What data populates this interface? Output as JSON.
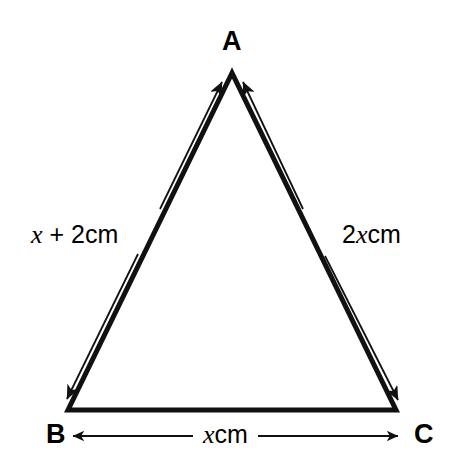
{
  "figure": {
    "type": "geometry-diagram",
    "shape": "triangle",
    "background_color": "#ffffff",
    "ink_color": "#000000",
    "vertices": [
      {
        "id": "A",
        "label": "A",
        "x": 232,
        "y": 73,
        "label_x": 222,
        "label_y": 28
      },
      {
        "id": "B",
        "label": "B",
        "x": 68,
        "y": 410,
        "label_x": 46,
        "label_y": 421
      },
      {
        "id": "C",
        "label": "C",
        "x": 396,
        "y": 410,
        "label_x": 414,
        "label_y": 421
      }
    ],
    "sides": [
      {
        "id": "AB",
        "from": "B",
        "to": "A",
        "label_plain": "x + 2cm",
        "label_parts": [
          {
            "text": "x",
            "style": "italic"
          },
          {
            "text": " + 2cm",
            "style": "upright"
          }
        ],
        "label_x": 29,
        "label_y": 222,
        "arrow": "double-headed",
        "arrow_side": "outside-left"
      },
      {
        "id": "AC",
        "from": "A",
        "to": "C",
        "label_plain": "2xcm",
        "label_parts": [
          {
            "text": "2",
            "style": "upright"
          },
          {
            "text": "x",
            "style": "italic"
          },
          {
            "text": "cm",
            "style": "upright"
          }
        ],
        "label_x": 340,
        "label_y": 222,
        "arrow": "double-headed",
        "arrow_side": "outside-right"
      },
      {
        "id": "BC",
        "from": "B",
        "to": "C",
        "label_plain": "xcm",
        "label_parts": [
          {
            "text": "x",
            "style": "italic"
          },
          {
            "text": "cm",
            "style": "upright"
          }
        ],
        "label_x": 197,
        "label_y": 422,
        "arrow": "double-headed",
        "arrow_side": "below"
      }
    ],
    "stroke_widths": {
      "triangle_outline": 5,
      "dimension_line": 1.8
    }
  }
}
